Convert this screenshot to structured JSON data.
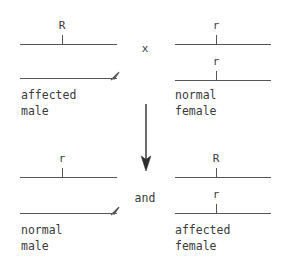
{
  "diagram": {
    "line_color": "#555555",
    "text_color": "#3a3a3a",
    "background": "#ffffff",
    "cross_operator": "x",
    "result_connector": "and",
    "arrow_direction": "down",
    "parents": [
      {
        "id": "parent-male",
        "sex": "male",
        "phenotype_line1": "affected",
        "phenotype_line2": "male",
        "chromosomes": [
          {
            "id": "x-chromosome",
            "allele": "R",
            "has_arrowhead": false
          },
          {
            "id": "y-chromosome",
            "allele": "",
            "has_arrowhead": true
          }
        ]
      },
      {
        "id": "parent-female",
        "sex": "female",
        "phenotype_line1": "normal",
        "phenotype_line2": "female",
        "chromosomes": [
          {
            "id": "x-chromosome-1",
            "allele": "r",
            "has_arrowhead": false
          },
          {
            "id": "x-chromosome-2",
            "allele": "r",
            "has_arrowhead": false
          }
        ]
      }
    ],
    "offspring": [
      {
        "id": "offspring-male",
        "sex": "male",
        "phenotype_line1": "normal",
        "phenotype_line2": "male",
        "chromosomes": [
          {
            "id": "x-chromosome",
            "allele": "r",
            "has_arrowhead": false
          },
          {
            "id": "y-chromosome",
            "allele": "",
            "has_arrowhead": true
          }
        ]
      },
      {
        "id": "offspring-female",
        "sex": "female",
        "phenotype_line1": "affected",
        "phenotype_line2": "female",
        "chromosomes": [
          {
            "id": "x-chromosome-1",
            "allele": "R",
            "has_arrowhead": false
          },
          {
            "id": "x-chromosome-2",
            "allele": "r",
            "has_arrowhead": false
          }
        ]
      }
    ]
  }
}
